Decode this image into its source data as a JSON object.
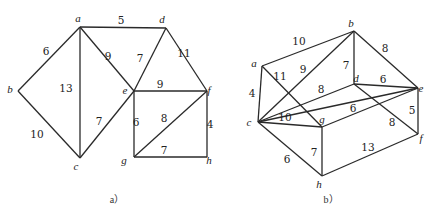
{
  "figure": {
    "graphs": [
      {
        "id": "a",
        "caption": "a）",
        "caption_pos": [
          117,
          203
        ],
        "nodes": [
          {
            "id": "a",
            "label": "a",
            "x": 80,
            "y": 27,
            "lx": 78,
            "ly": 22
          },
          {
            "id": "b",
            "label": "b",
            "x": 18,
            "y": 91,
            "lx": 10,
            "ly": 93
          },
          {
            "id": "c",
            "label": "c",
            "x": 80,
            "y": 158,
            "lx": 76,
            "ly": 170
          },
          {
            "id": "d",
            "label": "d",
            "x": 166,
            "y": 28,
            "lx": 162,
            "ly": 23
          },
          {
            "id": "e",
            "label": "e",
            "x": 134,
            "y": 91,
            "lx": 125,
            "ly": 94
          },
          {
            "id": "f",
            "label": "f",
            "x": 207,
            "y": 91,
            "lx": 209,
            "ly": 94
          },
          {
            "id": "g",
            "label": "g",
            "x": 134,
            "y": 157,
            "lx": 124,
            "ly": 164
          },
          {
            "id": "h",
            "label": "h",
            "x": 207,
            "y": 157,
            "lx": 209,
            "ly": 164
          }
        ],
        "edges": [
          {
            "from": "a",
            "to": "d",
            "weight": "5",
            "wx": 121,
            "wy": 24
          },
          {
            "from": "a",
            "to": "b",
            "weight": "6",
            "wx": 46,
            "wy": 55
          },
          {
            "from": "a",
            "to": "c",
            "weight": "13",
            "wx": 66,
            "wy": 92
          },
          {
            "from": "a",
            "to": "e",
            "weight": "9",
            "wx": 108,
            "wy": 60
          },
          {
            "from": "b",
            "to": "c",
            "weight": "10",
            "wx": 37,
            "wy": 138
          },
          {
            "from": "c",
            "to": "e",
            "weight": "7",
            "wx": 99,
            "wy": 125
          },
          {
            "from": "d",
            "to": "e",
            "weight": "7",
            "wx": 140,
            "wy": 62
          },
          {
            "from": "d",
            "to": "f",
            "weight": "11",
            "wx": 184,
            "wy": 57
          },
          {
            "from": "e",
            "to": "f",
            "weight": "9",
            "wx": 160,
            "wy": 88
          },
          {
            "from": "e",
            "to": "g",
            "weight": "6",
            "wx": 136,
            "wy": 126
          },
          {
            "from": "g",
            "to": "f",
            "weight": "8",
            "wx": 164,
            "wy": 122
          },
          {
            "from": "f",
            "to": "h",
            "weight": "4",
            "wx": 210,
            "wy": 128
          },
          {
            "from": "g",
            "to": "h",
            "weight": "7",
            "wx": 164,
            "wy": 154
          }
        ]
      },
      {
        "id": "b",
        "caption": "b）",
        "caption_pos": [
          331,
          203
        ],
        "nodes": [
          {
            "id": "a",
            "label": "a",
            "x": 262,
            "y": 66,
            "lx": 254,
            "ly": 67
          },
          {
            "id": "b",
            "label": "b",
            "x": 354,
            "y": 31,
            "lx": 351,
            "ly": 27
          },
          {
            "id": "c",
            "label": "c",
            "x": 258,
            "y": 122,
            "lx": 249,
            "ly": 126
          },
          {
            "id": "d",
            "label": "d",
            "x": 354,
            "y": 84,
            "lx": 356,
            "ly": 82
          },
          {
            "id": "e",
            "label": "e",
            "x": 418,
            "y": 88,
            "lx": 421,
            "ly": 92
          },
          {
            "id": "f",
            "label": "f",
            "x": 418,
            "y": 134,
            "lx": 421,
            "ly": 142
          },
          {
            "id": "g",
            "label": "g",
            "x": 322,
            "y": 127,
            "lx": 322,
            "ly": 123
          },
          {
            "id": "h",
            "label": "h",
            "x": 322,
            "y": 176,
            "lx": 319,
            "ly": 188
          }
        ],
        "edges": [
          {
            "from": "a",
            "to": "b",
            "weight": "10",
            "wx": 299,
            "wy": 45
          },
          {
            "from": "a",
            "to": "c",
            "weight": "4",
            "wx": 252,
            "wy": 97
          },
          {
            "from": "a",
            "to": "g",
            "weight": "11",
            "wx": 280,
            "wy": 80
          },
          {
            "from": "c",
            "to": "b",
            "weight": "9",
            "wx": 303,
            "wy": 73
          },
          {
            "from": "b",
            "to": "d",
            "weight": "7",
            "wx": 346,
            "wy": 69
          },
          {
            "from": "b",
            "to": "e",
            "weight": "8",
            "wx": 385,
            "wy": 52
          },
          {
            "from": "c",
            "to": "d",
            "weight": "8",
            "wx": 321,
            "wy": 93
          },
          {
            "from": "d",
            "to": "e",
            "weight": "6",
            "wx": 383,
            "wy": 83
          },
          {
            "from": "c",
            "to": "g",
            "weight": "10",
            "wx": 285,
            "wy": 121
          },
          {
            "from": "c",
            "to": "e",
            "weight": "",
            "wx": 0,
            "wy": 0
          },
          {
            "from": "g",
            "to": "e",
            "weight": "6",
            "wx": 353,
            "wy": 112
          },
          {
            "from": "d",
            "to": "f",
            "weight": "8",
            "wx": 392,
            "wy": 126
          },
          {
            "from": "e",
            "to": "f",
            "weight": "5",
            "wx": 412,
            "wy": 114
          },
          {
            "from": "c",
            "to": "h",
            "weight": "6",
            "wx": 287,
            "wy": 163
          },
          {
            "from": "g",
            "to": "h",
            "weight": "7",
            "wx": 314,
            "wy": 156
          },
          {
            "from": "h",
            "to": "f",
            "weight": "13",
            "wx": 368,
            "wy": 151
          }
        ]
      }
    ]
  }
}
